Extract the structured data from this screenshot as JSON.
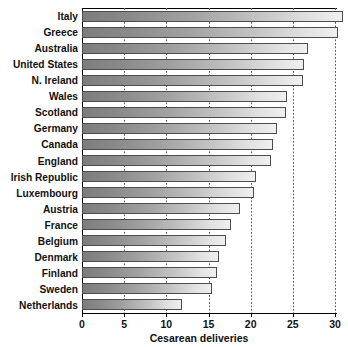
{
  "chart_data": {
    "type": "bar",
    "orientation": "horizontal",
    "title": "",
    "xlabel": "Cesarean deliveries",
    "ylabel": "",
    "xlim": [
      0,
      30
    ],
    "xticks": [
      0,
      5,
      10,
      15,
      20,
      25,
      30
    ],
    "xtick_labels": [
      "0",
      "5",
      "10",
      "15",
      "20",
      "25",
      "30"
    ],
    "grid": "vertical-dotted",
    "legend": "none",
    "categories": [
      "Italy",
      "Greece",
      "Australia",
      "United States",
      "N. Ireland",
      "Wales",
      "Scotland",
      "Germany",
      "Canada",
      "England",
      "Irish Republic",
      "Luxembourg",
      "Austria",
      "France",
      "Belgium",
      "Denmark",
      "Finland",
      "Sweden",
      "Netherlands"
    ],
    "values": [
      31.0,
      30.4,
      26.8,
      26.3,
      26.2,
      24.3,
      24.2,
      23.1,
      22.6,
      22.4,
      20.6,
      20.4,
      18.7,
      17.7,
      17.1,
      16.3,
      16.0,
      15.4,
      11.8
    ],
    "bar_fill": {
      "gradient_start": "#7d7d7d",
      "gradient_end": "#efefef",
      "border": "#4d4d4d"
    },
    "axis_color": "#000000",
    "text_color": "#111111"
  }
}
